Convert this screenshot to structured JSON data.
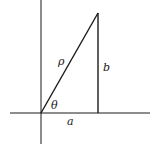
{
  "diagram": {
    "type": "right-triangle-polar",
    "labels": {
      "hypotenuse": "ρ",
      "opposite": "b",
      "angle": "θ",
      "adjacent": "a"
    },
    "geometry": {
      "origin": [
        41,
        113
      ],
      "apex": [
        98,
        13
      ],
      "foot": [
        98,
        113
      ],
      "x_axis": [
        10,
        150
      ],
      "y_axis": [
        0,
        144
      ]
    },
    "colors": {
      "line": "#1a1a1a",
      "background": "#ffffff"
    }
  }
}
